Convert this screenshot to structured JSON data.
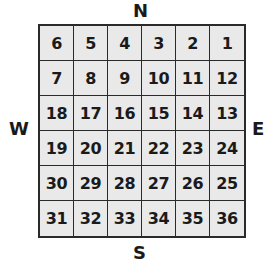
{
  "compass": {
    "north": "N",
    "south": "S",
    "west": "W",
    "east": "E"
  },
  "grid": {
    "rows": 6,
    "cols": 6,
    "cells": [
      [
        "6",
        "5",
        "4",
        "3",
        "2",
        "1"
      ],
      [
        "7",
        "8",
        "9",
        "10",
        "11",
        "12"
      ],
      [
        "18",
        "17",
        "16",
        "15",
        "14",
        "13"
      ],
      [
        "19",
        "20",
        "21",
        "22",
        "23",
        "24"
      ],
      [
        "30",
        "29",
        "28",
        "27",
        "26",
        "25"
      ],
      [
        "31",
        "32",
        "33",
        "34",
        "35",
        "36"
      ]
    ]
  },
  "colors": {
    "cell_fill": "#e9e9e9",
    "line": "#2a2a2a",
    "text": "#1a1a1a"
  }
}
